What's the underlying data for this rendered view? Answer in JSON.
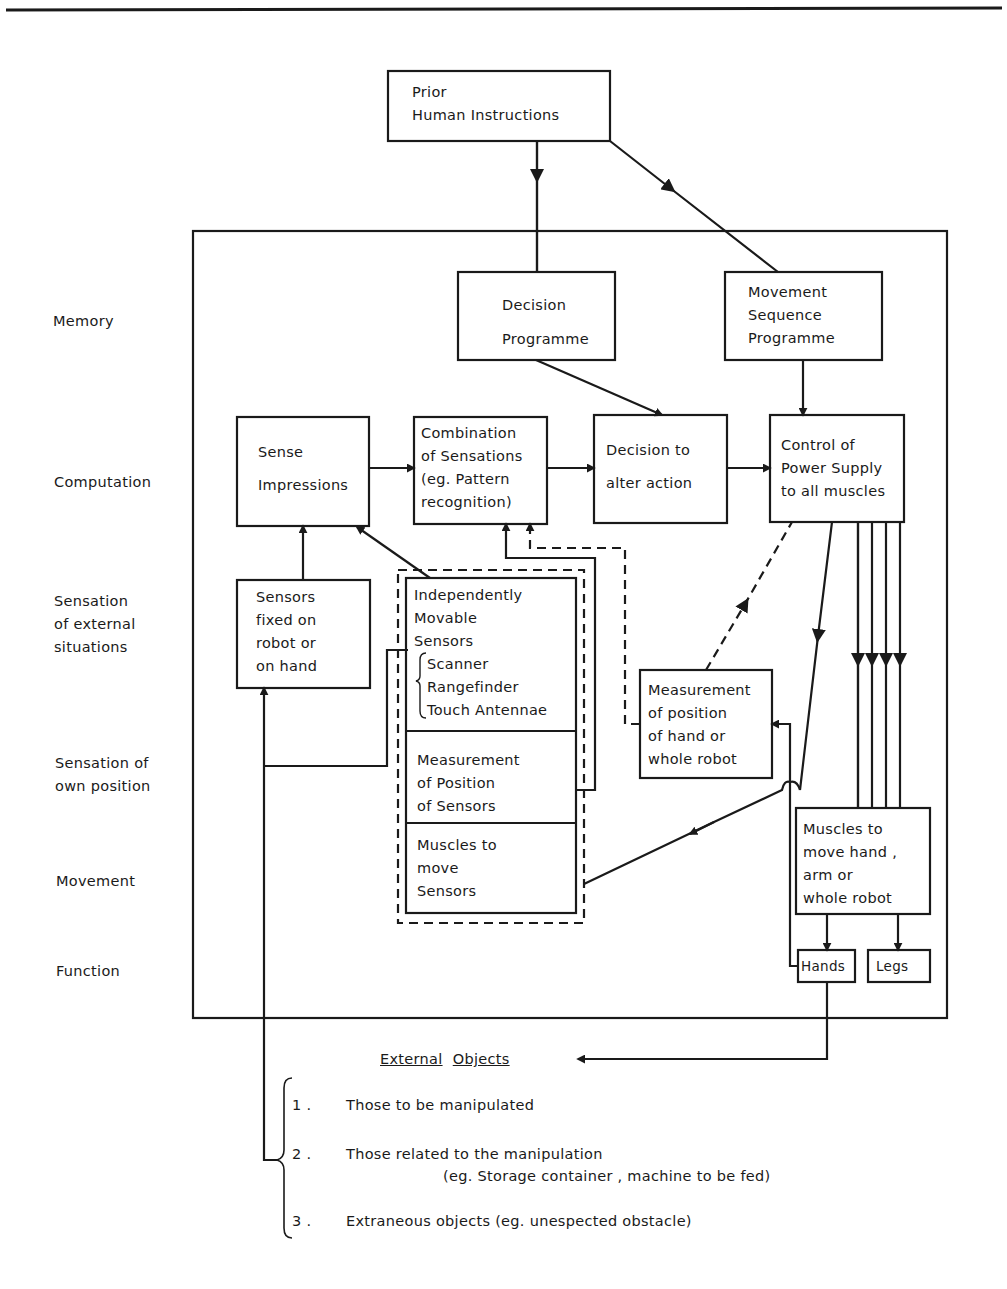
{
  "page": {
    "header_rule": true
  },
  "row_labels": [
    {
      "id": "memory",
      "text": "Memory"
    },
    {
      "id": "computation",
      "text": "Computation"
    },
    {
      "id": "sensation-external",
      "lines": [
        "Sensation",
        "of external",
        "situations"
      ]
    },
    {
      "id": "sensation-own",
      "lines": [
        "Sensation of",
        "own position"
      ]
    },
    {
      "id": "movement",
      "text": "Movement"
    },
    {
      "id": "function",
      "text": "Function"
    }
  ],
  "boxes": {
    "prior_instructions": {
      "lines": [
        "Prior",
        "Human  Instructions"
      ]
    },
    "decision_programme": {
      "lines": [
        "Decision",
        "Programme"
      ]
    },
    "movement_sequence": {
      "lines": [
        "Movement",
        "Sequence",
        "Programme"
      ]
    },
    "sense_impressions": {
      "lines": [
        "Sense",
        "Impressions"
      ]
    },
    "combination": {
      "lines": [
        "Combination",
        "of Sensations",
        "(eg. Pattern",
        "recognition)"
      ]
    },
    "decision_alter": {
      "lines": [
        "Decision  to",
        "alter  action"
      ]
    },
    "control_power": {
      "lines": [
        "Control of",
        "Power Supply",
        "to all muscles"
      ]
    },
    "sensors_fixed": {
      "lines": [
        "Sensors",
        "fixed  on",
        "robot  or",
        "on  hand"
      ]
    },
    "independent_sensors": {
      "lines": [
        "Independently",
        "Movable",
        "Sensors"
      ],
      "sub_items": [
        "Scanner",
        "Rangefinder",
        "Touch Antennae"
      ]
    },
    "measure_sensors": {
      "lines": [
        "Measurement",
        "of Position",
        "of Sensors"
      ]
    },
    "muscles_sensors": {
      "lines": [
        "Muscles  to",
        "move",
        "Sensors"
      ]
    },
    "measure_hand": {
      "lines": [
        "Measurement",
        "of position",
        "of hand or",
        "whole robot"
      ]
    },
    "muscles_hand": {
      "lines": [
        "Muscles  to",
        "move hand ,",
        "arm  or",
        "whole robot"
      ]
    },
    "hands": {
      "text": "Hands"
    },
    "legs": {
      "text": "Legs"
    }
  },
  "external_objects": {
    "title_words": [
      "External",
      "Objects"
    ],
    "items": [
      {
        "num": "1 .",
        "text": "Those to be manipulated"
      },
      {
        "num": "2 .",
        "text": "Those related to the manipulation",
        "sub": "(eg. Storage container , machine to be fed)"
      },
      {
        "num": "3 .",
        "text": "Extraneous  objects (eg. unespected obstacle)"
      }
    ]
  },
  "colors": {
    "ink": "#1a1a1a",
    "paper": "#ffffff"
  }
}
